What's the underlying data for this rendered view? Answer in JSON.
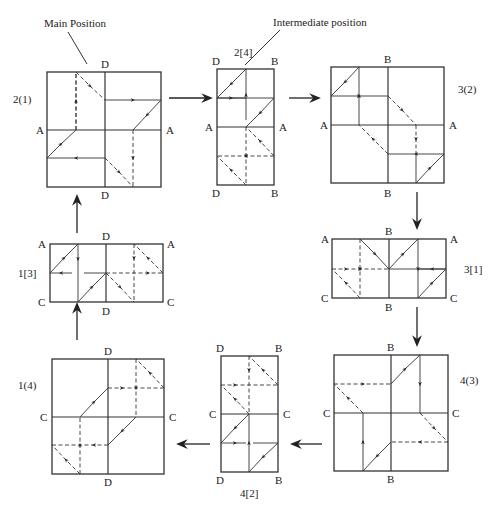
{
  "annotations": {
    "main_position": "Main Position",
    "intermediate_position": "Intermediate position"
  },
  "panels": [
    {
      "id": "2(1)",
      "label": "2(1)",
      "type": "main",
      "corners": {
        "top": "D",
        "bottom": "D",
        "left": "A",
        "right": "A"
      }
    },
    {
      "id": "2[4]",
      "label": "2[4]",
      "type": "intermediate",
      "corners": {
        "top_left": "D",
        "top_right": "B",
        "mid_left": "A",
        "mid_right": "A",
        "bottom_left": "D",
        "bottom_right": "B"
      }
    },
    {
      "id": "3(2)",
      "label": "3(2)",
      "type": "main",
      "corners": {
        "top": "B",
        "bottom": "B",
        "left": "A",
        "right": "A"
      }
    },
    {
      "id": "3[1]",
      "label": "3[1]",
      "type": "intermediate",
      "corners": {
        "top_left": "A",
        "top_mid": "B",
        "top_right": "A",
        "bottom_left": "C",
        "bottom_mid": "B",
        "bottom_right": "C"
      }
    },
    {
      "id": "4(3)",
      "label": "4(3)",
      "type": "main",
      "corners": {
        "top": "B",
        "bottom": "B",
        "left": "C",
        "right": "C"
      }
    },
    {
      "id": "4[2]",
      "label": "4[2]",
      "type": "intermediate",
      "corners": {
        "top_left": "D",
        "top_right": "B",
        "mid_left": "C",
        "mid_right": "C",
        "bottom_left": "D",
        "bottom_right": "B"
      }
    },
    {
      "id": "1(4)",
      "label": "1(4)",
      "type": "main",
      "corners": {
        "top": "D",
        "bottom": "D",
        "left": "C",
        "right": "C"
      }
    },
    {
      "id": "1[3]",
      "label": "1[3]",
      "type": "intermediate",
      "corners": {
        "top_left": "A",
        "top_mid": "D",
        "top_right": "A",
        "bottom_left": "C",
        "bottom_mid": "D",
        "bottom_right": "C"
      }
    }
  ],
  "sequence": [
    "2(1)",
    "2[4]",
    "3(2)",
    "3[1]",
    "4(3)",
    "4[2]",
    "1(4)",
    "1[3]",
    "2(1)"
  ],
  "legend": {
    "solid_line": "visible path",
    "dashed_line": "hidden path"
  }
}
